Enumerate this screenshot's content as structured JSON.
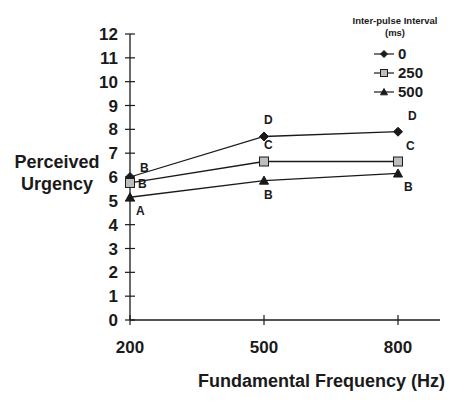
{
  "chart_data": {
    "type": "line",
    "title": "",
    "xlabel": "Fundamental Frequency (Hz)",
    "ylabel": "Perceived Urgency",
    "categories": [
      "200",
      "500",
      "800"
    ],
    "ylim": [
      0,
      12
    ],
    "yticks": [
      "0",
      "1",
      "2",
      "3",
      "4",
      "5",
      "6",
      "7",
      "8",
      "9",
      "10",
      "11",
      "12"
    ],
    "grid": false,
    "legend": {
      "title": "Inter-pulse Interval (ms)",
      "title_lines": [
        "Inter-pulse Interval",
        "(ms)"
      ],
      "placement": "top-right"
    },
    "series": [
      {
        "name": "0",
        "marker": "diamond",
        "color": "#1a1a1a",
        "fill": "#1a1a1a",
        "values": [
          6.0,
          7.7,
          7.9
        ],
        "annotations": [
          "B",
          "D",
          "D"
        ]
      },
      {
        "name": "250",
        "marker": "square",
        "color": "#1a1a1a",
        "fill": "#bdbdbd",
        "values": [
          5.75,
          6.65,
          6.65
        ],
        "annotations": [
          "B",
          "C",
          "C"
        ]
      },
      {
        "name": "500",
        "marker": "triangle",
        "color": "#1a1a1a",
        "fill": "#1a1a1a",
        "values": [
          5.15,
          5.85,
          6.15
        ],
        "annotations": [
          "A",
          "B",
          "B"
        ]
      }
    ]
  }
}
